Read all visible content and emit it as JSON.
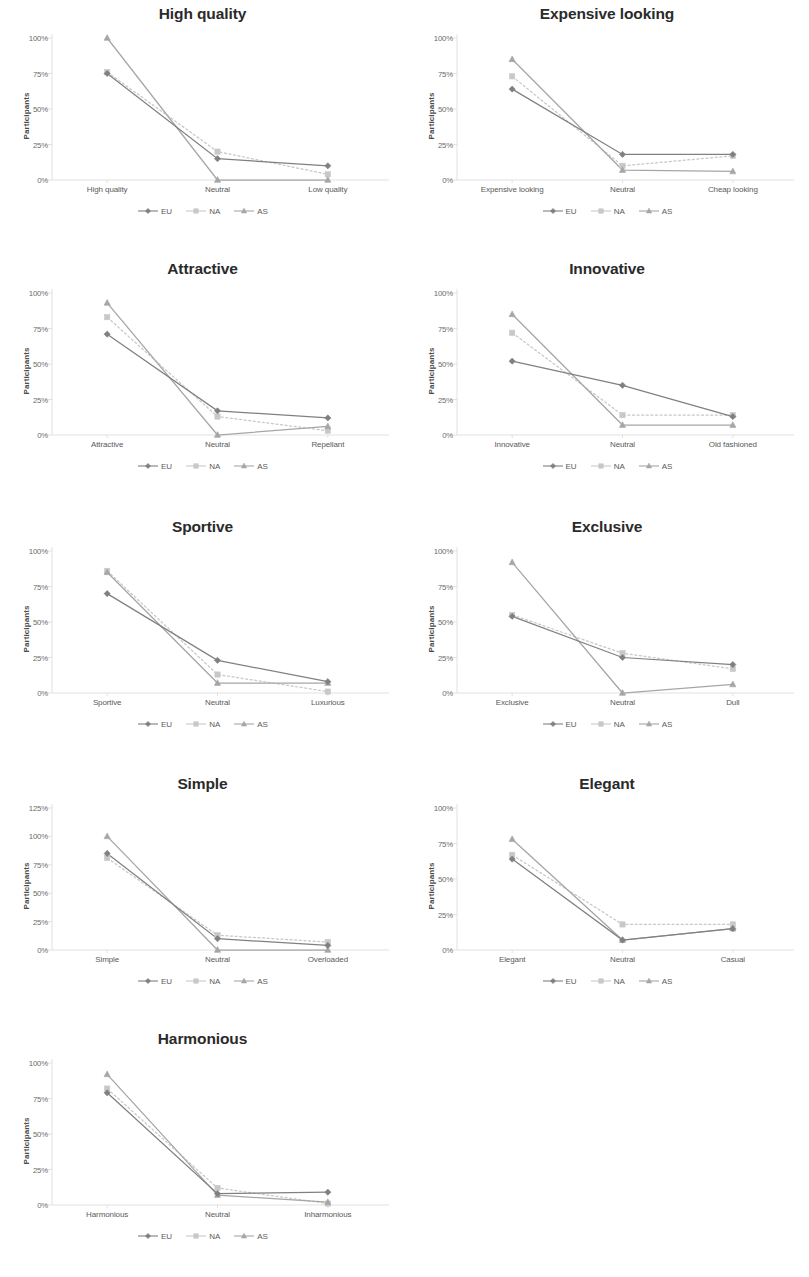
{
  "figure": {
    "ylabel": "Participants",
    "legend": [
      {
        "name": "EU",
        "color": "#808080",
        "marker": "diamond"
      },
      {
        "name": "NA",
        "color": "#c8c8c8",
        "marker": "square"
      },
      {
        "name": "AS",
        "color": "#a6a6a6",
        "marker": "triangle"
      }
    ]
  },
  "chart_data": [
    {
      "type": "line",
      "title": "High quality",
      "xlabel": "",
      "ylabel": "Participants",
      "categories": [
        "High quality",
        "Neutral",
        "Low quality"
      ],
      "yticks": [
        "0%",
        "25%",
        "50%",
        "75%",
        "100%"
      ],
      "ylim": [
        0,
        100
      ],
      "grid": false,
      "legend_position": "bottom",
      "series": [
        {
          "name": "EU",
          "values": [
            75,
            15,
            10
          ]
        },
        {
          "name": "NA",
          "values": [
            76,
            20,
            4
          ]
        },
        {
          "name": "AS",
          "values": [
            100,
            0,
            0
          ]
        }
      ]
    },
    {
      "type": "line",
      "title": "Expensive looking",
      "xlabel": "",
      "ylabel": "Participants",
      "categories": [
        "Expensive looking",
        "Neutral",
        "Cheap looking"
      ],
      "yticks": [
        "0%",
        "25%",
        "50%",
        "75%",
        "100%"
      ],
      "ylim": [
        0,
        100
      ],
      "grid": false,
      "legend_position": "bottom",
      "series": [
        {
          "name": "EU",
          "values": [
            64,
            18,
            18
          ]
        },
        {
          "name": "NA",
          "values": [
            73,
            10,
            17
          ]
        },
        {
          "name": "AS",
          "values": [
            85,
            7,
            6
          ]
        }
      ]
    },
    {
      "type": "line",
      "title": "Attractive",
      "xlabel": "",
      "ylabel": "Participants",
      "categories": [
        "Attractive",
        "Neutral",
        "Repellant"
      ],
      "yticks": [
        "0%",
        "25%",
        "50%",
        "75%",
        "100%"
      ],
      "ylim": [
        0,
        100
      ],
      "grid": false,
      "legend_position": "bottom",
      "series": [
        {
          "name": "EU",
          "values": [
            71,
            17,
            12
          ]
        },
        {
          "name": "NA",
          "values": [
            83,
            13,
            3
          ]
        },
        {
          "name": "AS",
          "values": [
            93,
            0,
            6
          ]
        }
      ]
    },
    {
      "type": "line",
      "title": "Innovative",
      "xlabel": "",
      "ylabel": "Participants",
      "categories": [
        "Innovative",
        "Neutral",
        "Old fashioned"
      ],
      "yticks": [
        "0%",
        "25%",
        "50%",
        "75%",
        "100%"
      ],
      "ylim": [
        0,
        100
      ],
      "grid": false,
      "legend_position": "bottom",
      "series": [
        {
          "name": "EU",
          "values": [
            52,
            35,
            13
          ]
        },
        {
          "name": "NA",
          "values": [
            72,
            14,
            14
          ]
        },
        {
          "name": "AS",
          "values": [
            85,
            7,
            7
          ]
        }
      ]
    },
    {
      "type": "line",
      "title": "Sportive",
      "xlabel": "",
      "ylabel": "Participants",
      "categories": [
        "Sportive",
        "Neutral",
        "Luxurious"
      ],
      "yticks": [
        "0%",
        "25%",
        "50%",
        "75%",
        "100%"
      ],
      "ylim": [
        0,
        100
      ],
      "grid": false,
      "legend_position": "bottom",
      "series": [
        {
          "name": "EU",
          "values": [
            70,
            23,
            8
          ]
        },
        {
          "name": "NA",
          "values": [
            86,
            13,
            1
          ]
        },
        {
          "name": "AS",
          "values": [
            85,
            7,
            7
          ]
        }
      ]
    },
    {
      "type": "line",
      "title": "Exclusive",
      "xlabel": "",
      "ylabel": "Participants",
      "categories": [
        "Exclusive",
        "Neutral",
        "Dull"
      ],
      "yticks": [
        "0%",
        "25%",
        "50%",
        "75%",
        "100%"
      ],
      "ylim": [
        0,
        100
      ],
      "grid": false,
      "legend_position": "bottom",
      "series": [
        {
          "name": "EU",
          "values": [
            54,
            25,
            20
          ]
        },
        {
          "name": "NA",
          "values": [
            55,
            28,
            17
          ]
        },
        {
          "name": "AS",
          "values": [
            92,
            0,
            6
          ]
        }
      ]
    },
    {
      "type": "line",
      "title": "Simple",
      "xlabel": "",
      "ylabel": "Participants",
      "categories": [
        "Simple",
        "Neutral",
        "Overloaded"
      ],
      "yticks": [
        "0%",
        "25%",
        "50%",
        "75%",
        "100%",
        "125%"
      ],
      "ylim": [
        0,
        125
      ],
      "grid": false,
      "legend_position": "bottom",
      "series": [
        {
          "name": "EU",
          "values": [
            85,
            10,
            4
          ]
        },
        {
          "name": "NA",
          "values": [
            81,
            13,
            7
          ]
        },
        {
          "name": "AS",
          "values": [
            100,
            0,
            0
          ]
        }
      ]
    },
    {
      "type": "line",
      "title": "Elegant",
      "xlabel": "",
      "ylabel": "Participants",
      "categories": [
        "Elegant",
        "Neutral",
        "Casual"
      ],
      "yticks": [
        "0%",
        "25%",
        "50%",
        "75%",
        "100%"
      ],
      "ylim": [
        0,
        100
      ],
      "grid": false,
      "legend_position": "bottom",
      "series": [
        {
          "name": "EU",
          "values": [
            64,
            7,
            15
          ]
        },
        {
          "name": "NA",
          "values": [
            67,
            18,
            18
          ]
        },
        {
          "name": "AS",
          "values": [
            78,
            7,
            15
          ]
        }
      ]
    },
    {
      "type": "line",
      "title": "Harmonious",
      "xlabel": "",
      "ylabel": "Participants",
      "categories": [
        "Harmonious",
        "Neutral",
        "Inharmonious"
      ],
      "yticks": [
        "0%",
        "25%",
        "50%",
        "75%",
        "100%"
      ],
      "ylim": [
        0,
        100
      ],
      "grid": false,
      "legend_position": "bottom",
      "series": [
        {
          "name": "EU",
          "values": [
            79,
            8,
            9
          ]
        },
        {
          "name": "NA",
          "values": [
            82,
            12,
            1
          ]
        },
        {
          "name": "AS",
          "values": [
            92,
            7,
            2
          ]
        }
      ]
    }
  ]
}
